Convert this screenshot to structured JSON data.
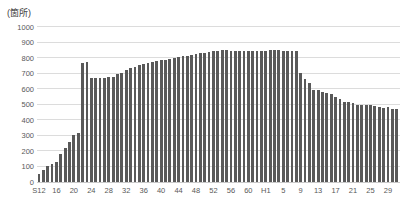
{
  "chart": {
    "unit_label": "(箇所)",
    "bar_color": "#595959",
    "grid_color": "#dcdcdc",
    "baseline_color": "#c9c9c9",
    "text_color": "#595959"
  },
  "chart_data": {
    "type": "bar",
    "title": "",
    "xlabel": "",
    "ylabel": "(箇所)",
    "ylim": [
      0,
      1000
    ],
    "ytick_step": 100,
    "grid": true,
    "legend": false,
    "x_tick_every": 4,
    "x_tick_labels": [
      "S12",
      "16",
      "20",
      "24",
      "28",
      "32",
      "36",
      "40",
      "44",
      "48",
      "52",
      "56",
      "60",
      "H1",
      "5",
      "9",
      "13",
      "17",
      "21",
      "25",
      "29"
    ],
    "categories": [
      "S12",
      "S13",
      "S14",
      "S15",
      "S16",
      "S17",
      "S18",
      "S19",
      "S20",
      "S21",
      "S22",
      "S23",
      "S24",
      "S25",
      "S26",
      "S27",
      "S28",
      "S29",
      "S30",
      "S31",
      "S32",
      "S33",
      "S34",
      "S35",
      "S36",
      "S37",
      "S38",
      "S39",
      "S40",
      "S41",
      "S42",
      "S43",
      "S44",
      "S45",
      "S46",
      "S47",
      "S48",
      "S49",
      "S50",
      "S51",
      "S52",
      "S53",
      "S54",
      "S55",
      "S56",
      "S57",
      "S58",
      "S59",
      "S60",
      "S61",
      "S62",
      "S63",
      "H1",
      "H2",
      "H3",
      "H4",
      "H5",
      "H6",
      "H7",
      "H8",
      "H9",
      "H10",
      "H11",
      "H12",
      "H13",
      "H14",
      "H15",
      "H16",
      "H17",
      "H18",
      "H19",
      "H20",
      "H21",
      "H22",
      "H23",
      "H24",
      "H25",
      "H26",
      "H27",
      "H28",
      "H29",
      "H30",
      "R1"
    ],
    "values": [
      49,
      77,
      104,
      118,
      131,
      181,
      218,
      257,
      306,
      317,
      770,
      773,
      668,
      670,
      672,
      672,
      675,
      680,
      695,
      705,
      720,
      735,
      745,
      752,
      760,
      768,
      775,
      780,
      785,
      790,
      795,
      800,
      805,
      810,
      815,
      820,
      825,
      830,
      835,
      840,
      845,
      848,
      850,
      850,
      848,
      847,
      845,
      845,
      845,
      845,
      845,
      848,
      848,
      850,
      852,
      852,
      848,
      847,
      845,
      845,
      706,
      663,
      641,
      594,
      592,
      582,
      576,
      571,
      549,
      535,
      518,
      517,
      510,
      494,
      495,
      495,
      494,
      490,
      486,
      480,
      481,
      469,
      472
    ]
  }
}
